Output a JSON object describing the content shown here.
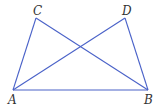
{
  "diagram": {
    "stroke_color": "#4a62c8",
    "label_color": "#333333",
    "points": {
      "A": {
        "label": "A",
        "x": 13,
        "y": 90
      },
      "B": {
        "label": "B",
        "x": 148,
        "y": 90
      },
      "C": {
        "label": "C",
        "x": 36,
        "y": 18
      },
      "D": {
        "label": "D",
        "x": 125,
        "y": 18
      }
    },
    "segments": [
      {
        "name": "AC",
        "from": "A",
        "to": "C"
      },
      {
        "name": "CB",
        "from": "C",
        "to": "B"
      },
      {
        "name": "AD",
        "from": "A",
        "to": "D"
      },
      {
        "name": "DB",
        "from": "D",
        "to": "B"
      },
      {
        "name": "AB",
        "from": "A",
        "to": "B"
      }
    ]
  }
}
